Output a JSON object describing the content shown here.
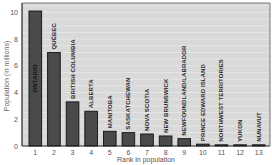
{
  "chart_data": {
    "type": "bar",
    "title": "",
    "xlabel": "Rank in population",
    "ylabel": "Population (in millions)",
    "ylim": [
      0,
      10.7
    ],
    "yticks": [
      0,
      2,
      4,
      6,
      8,
      10
    ],
    "grid": true,
    "legend": null,
    "categories": [
      "1",
      "2",
      "3",
      "4",
      "5",
      "6",
      "7",
      "8",
      "9",
      "10",
      "11",
      "12",
      "13"
    ],
    "bar_labels": [
      "ONTARIO",
      "QUÉBEC",
      "BRITISH COLUMBIA",
      "ALBERTA",
      "MANITOBA",
      "SASKATCHEWAN",
      "NOVA SCOTIA",
      "NEW BRUNSWICK",
      "NEWFOUNDLAND/LABRADOR",
      "PRINCE EDWARD ISLAND",
      "NORTHWEST TERRITORIES",
      "YUKON",
      "NUNAVUT"
    ],
    "values": [
      10.1,
      7.0,
      3.3,
      2.6,
      1.1,
      1.0,
      0.9,
      0.75,
      0.55,
      0.14,
      0.04,
      0.03,
      0.03
    ],
    "colors": {
      "plot_background": "#d9d9d9",
      "gridline": "#eeeeee",
      "bar_fill": "#4a4a4a",
      "bar_edge": "#111111",
      "axis": "#222222"
    }
  }
}
